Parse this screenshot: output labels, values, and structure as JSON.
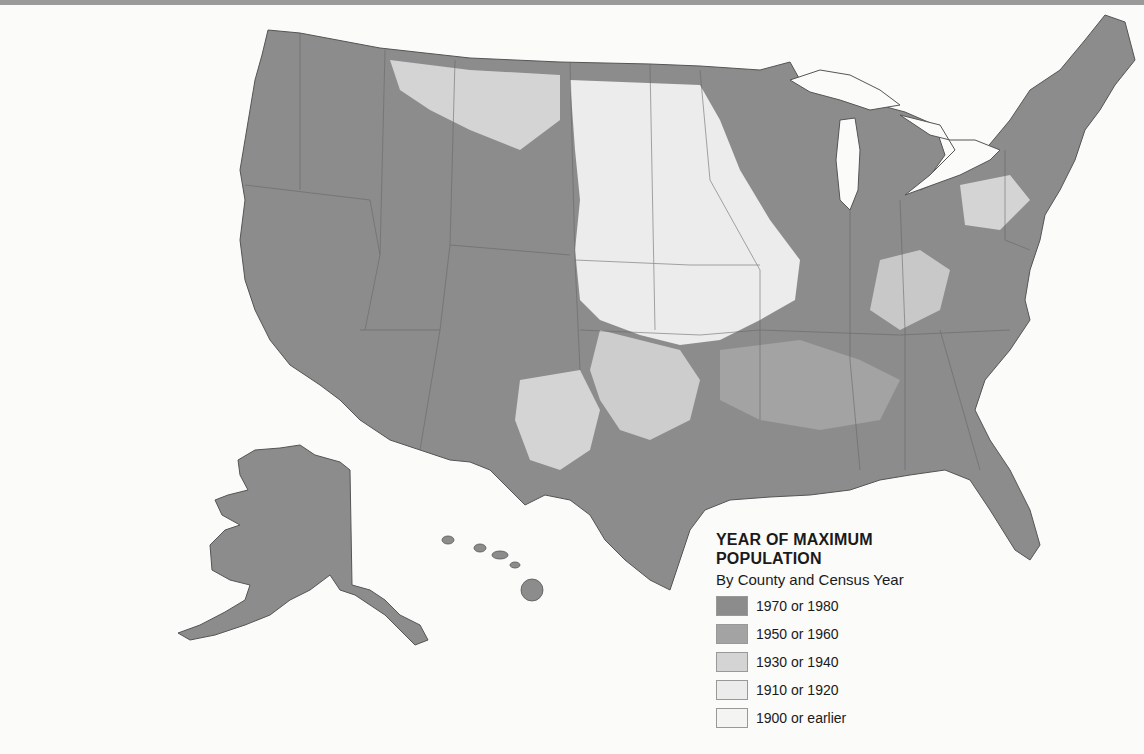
{
  "legend": {
    "title_line1": "YEAR OF MAXIMUM",
    "title_line2": "POPULATION",
    "subtitle": "By County and Census Year",
    "classes": [
      {
        "label": "1970 or 1980",
        "color": "#8c8c8c"
      },
      {
        "label": "1950 or 1960",
        "color": "#a3a3a3"
      },
      {
        "label": "1930 or 1940",
        "color": "#d4d4d4"
      },
      {
        "label": "1910 or 1920",
        "color": "#ececec"
      },
      {
        "label": "1900 or earlier",
        "color": "#f4f4f2"
      }
    ]
  },
  "map": {
    "subject": "United States counties by year of maximum population",
    "regions_shown": [
      "Contiguous United States",
      "Alaska",
      "Hawaii"
    ],
    "dominant_class_by_region": {
      "Pacific Coast": "1970 or 1980",
      "Mountain West": "1970 or 1980",
      "Great Plains": "1910 or 1920",
      "Midwest": "1970 or 1980",
      "South": "1970 or 1980",
      "Northeast": "1970 or 1980",
      "Alaska": "1970 or 1980",
      "Hawaii": "1970 or 1980"
    }
  }
}
